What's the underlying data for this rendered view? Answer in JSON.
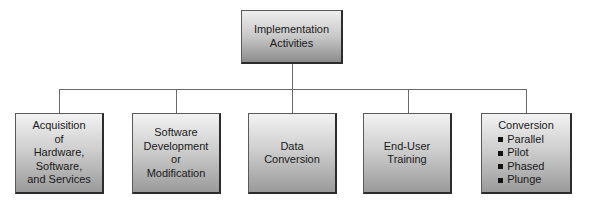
{
  "diagram": {
    "root": {
      "lines": [
        "Implementation",
        "Activities"
      ]
    },
    "children": [
      {
        "lines": [
          "Acquisition",
          "of",
          "Hardware,",
          "Software,",
          "and Services"
        ]
      },
      {
        "lines": [
          "Software",
          "Development",
          "or",
          "Modification"
        ]
      },
      {
        "lines": [
          "Data",
          "Conversion"
        ]
      },
      {
        "lines": [
          "End-User",
          "Training"
        ]
      },
      {
        "title": "Conversion",
        "bullets": [
          "Parallel",
          "Pilot",
          "Phased",
          "Plunge"
        ]
      }
    ],
    "colors": {
      "border": "#2c2c2c",
      "gradient_top": "#f2f2f2",
      "gradient_bottom": "#9a9a9a",
      "connector": "#6a6a6a",
      "text": "#1a1a1a"
    }
  }
}
